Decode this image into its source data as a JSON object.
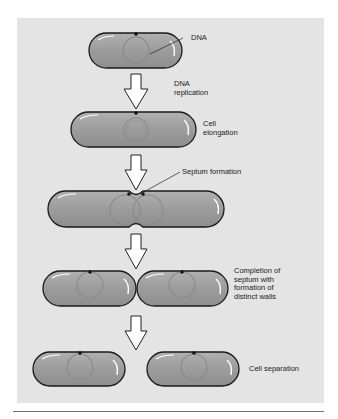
{
  "colors": {
    "panel": "#e4e4e4",
    "cell_fill": "#9d9d9d",
    "cell_stroke": "#1a1a1a",
    "nucleoid": "#8a8a8a",
    "arrow_fill": "#ffffff",
    "rule": "#707070"
  },
  "labels": {
    "dna": "DNA",
    "dna_replication_1": "DNA",
    "dna_replication_2": "replication",
    "cell_elongation_1": "Cell",
    "cell_elongation_2": "elongation",
    "septum_formation": "Septum formation",
    "completion_1": "Completion of",
    "completion_2": "septum with",
    "completion_3": "formation of",
    "completion_4": "distinct walls",
    "cell_separation": "Cell separation"
  },
  "stages": [
    {
      "name": "single cell",
      "cells": 1
    },
    {
      "name": "elongated cell",
      "cells": 1
    },
    {
      "name": "septum forming",
      "cells": 1
    },
    {
      "name": "septum complete",
      "cells": 2
    },
    {
      "name": "separated cells",
      "cells": 2
    }
  ]
}
